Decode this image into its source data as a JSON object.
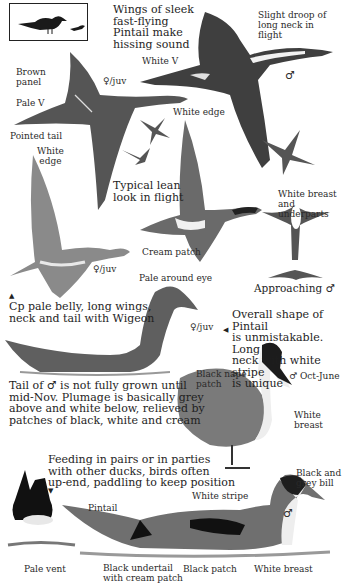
{
  "species": "Pintail",
  "thumbnail": {
    "description": "size comparison silhouettes"
  },
  "captions": {
    "wings": "Wings of sleek\nfast-flying\nPintail make\nhissing sound",
    "droop": "Slight droop of\nlong neck in\nflight",
    "lean": "Typical lean\nlook in flight",
    "white_breast_under": "White breast\nand underparts",
    "approaching": "Approaching ♂",
    "compare": "Cp pale belly, long wings,\nneck and tail with Wigeon",
    "overall": "Overall shape of Pintail\nis unmistakable. Long\nneck with white stripe\nis unique",
    "tail": "Tail of ♂ is not fully grown until\nmid-Nov. Plumage is basically grey\nabove and white below, relieved by\npatches of black, white and cream",
    "feeding": "Feeding in pairs or in parties\nwith other ducks, birds often\nup-end, paddling to keep position"
  },
  "labels": {
    "brown_panel": "Brown\npanel",
    "female_juv_1": "♀/juv",
    "white_v": "White V",
    "male_1": "♂",
    "pale_v": "Pale V",
    "white_edge_1": "White edge",
    "pointed_tail": "Pointed tail",
    "white_edge_2": "White\nedge",
    "cream_patch": "Cream patch",
    "female_juv_2": "♀/juv",
    "pale_around_eye": "Pale around eye",
    "female_juv_3": "♀/juv",
    "black_nape": "Black nape\npatch",
    "male_season": "♂ Oct-June",
    "white_breast_1": "White\nbreast",
    "black_grey_bill": "Black and\ngrey bill",
    "white_stripe": "White stripe",
    "male_2": "♂",
    "pintail": "Pintail",
    "pale_vent": "Pale vent",
    "black_undertail": "Black undertail\nwith cream patch",
    "black_patch": "Black patch",
    "white_breast_2": "White breast"
  },
  "colors": {
    "ink": "#222222",
    "mid": "#6b6b6b",
    "light": "#a8a8a8",
    "cream": "#e8e2d0",
    "water": "#9a9a9a"
  }
}
